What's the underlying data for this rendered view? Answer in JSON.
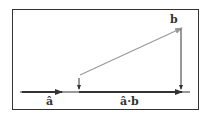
{
  "diagram": {
    "labels": {
      "a_hat": "â",
      "b": "b",
      "projection": "â·b"
    },
    "colors": {
      "axis": "#333333",
      "vector_b": "#888888",
      "frame": "#333333"
    }
  }
}
